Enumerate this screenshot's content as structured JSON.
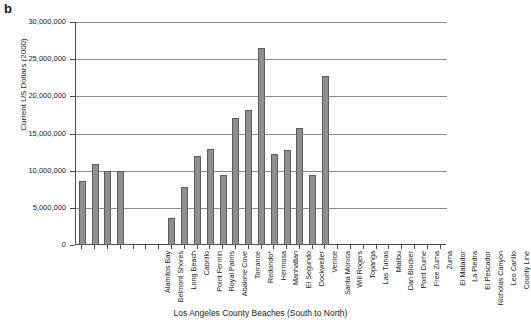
{
  "panel": {
    "letter": "b"
  },
  "chart_data": {
    "type": "bar",
    "title": "",
    "xlabel": "Los Angeles County Beaches (South to North)",
    "ylabel": "Current US Dollars (2000)",
    "ylim": [
      0,
      30000000
    ],
    "ytick_values": [
      0,
      5000000,
      10000000,
      15000000,
      20000000,
      25000000,
      30000000
    ],
    "ytick_labels": [
      "0",
      "5,000,000",
      "10,000,000",
      "15,000,000",
      "20,000,000",
      "25,000,000",
      "30,000,000"
    ],
    "grid": true,
    "legend": "none",
    "bar_color": "#8f8f8f",
    "bar_edge_color": "#5c5c5c",
    "categories": [
      "Alamitos Bay",
      "Belmont Shores",
      "Long Beach",
      "Cabrillo",
      "Point Fermin",
      "Royal Palms",
      "Abalone Cove",
      "Torrance",
      "Redondo*",
      "Hermosa",
      "Manhattan",
      "El Segundo",
      "Dockweiler",
      "Venice",
      "Santa Monica",
      "Will Rogers",
      "Topanga",
      "Las Tunas",
      "Malibu",
      "Dan Blocker",
      "Point Dume",
      "Free Zuma",
      "Zuma",
      "El Matador",
      "La Piedra",
      "El Pescador",
      "Nicholas Canyon",
      "Leo Carillo",
      "County Line"
    ],
    "values": [
      8600000,
      10900000,
      10000000,
      10000000,
      0,
      0,
      0,
      3600000,
      7800000,
      12000000,
      12900000,
      9400000,
      17100000,
      18200000,
      26500000,
      12200000,
      12800000,
      15700000,
      9400000,
      22800000,
      0,
      0,
      0,
      0,
      0,
      0,
      0,
      0,
      0
    ]
  }
}
